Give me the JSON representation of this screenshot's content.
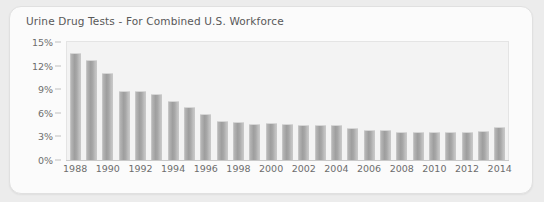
{
  "card": {
    "title": "Urine Drug Tests - For Combined U.S. Workforce"
  },
  "colors": {
    "page_background": "#ececec",
    "card_background": "#fbfbfb",
    "plot_background": "#f3f3f3",
    "bar_fill": "#a0a0a0",
    "axis": "#c9c9c9",
    "text": "#6d6d6d"
  },
  "chart_data": {
    "type": "bar",
    "title": "Urine Drug Tests - For Combined U.S. Workforce",
    "xlabel": "",
    "ylabel": "",
    "ylim": [
      0,
      15
    ],
    "yticks": [
      0,
      3,
      6,
      9,
      12,
      15
    ],
    "ytick_labels": [
      "0%",
      "3%",
      "6%",
      "9%",
      "12%",
      "15%"
    ],
    "grid": false,
    "legend": false,
    "categories": [
      "1988",
      "1989",
      "1990",
      "1991",
      "1992",
      "1993",
      "1994",
      "1995",
      "1996",
      "1997",
      "1998",
      "1999",
      "2000",
      "2001",
      "2002",
      "2003",
      "2004",
      "2005",
      "2006",
      "2007",
      "2008",
      "2009",
      "2010",
      "2011",
      "2012",
      "2013",
      "2014"
    ],
    "xtick_labels": [
      "1988",
      "",
      "1990",
      "",
      "1992",
      "",
      "1994",
      "",
      "1996",
      "",
      "1998",
      "",
      "2000",
      "",
      "2002",
      "",
      "2004",
      "",
      "2006",
      "",
      "2008",
      "",
      "2010",
      "",
      "2012",
      "",
      "2014"
    ],
    "values": [
      13.6,
      12.7,
      11.0,
      8.8,
      8.8,
      8.4,
      7.5,
      6.7,
      5.8,
      5.0,
      4.8,
      4.6,
      4.7,
      4.6,
      4.4,
      4.5,
      4.5,
      4.1,
      3.8,
      3.8,
      3.6,
      3.6,
      3.5,
      3.5,
      3.5,
      3.7,
      4.2
    ],
    "unit": "%"
  }
}
